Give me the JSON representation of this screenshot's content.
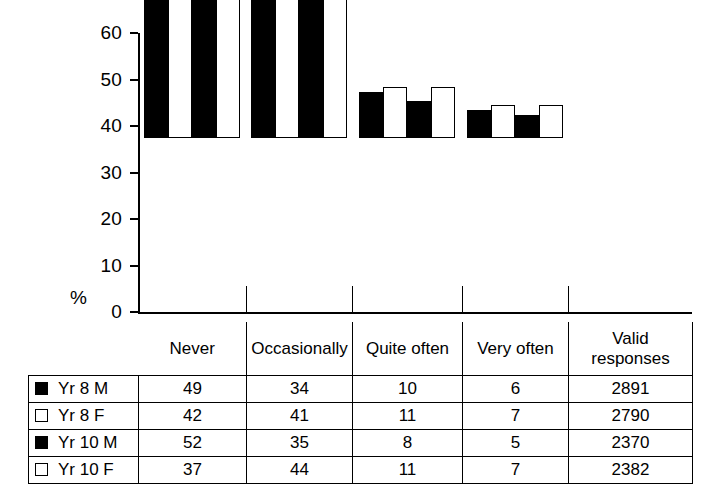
{
  "chart_data": {
    "type": "bar",
    "title": "",
    "xlabel": "",
    "ylabel": "%",
    "ylim": [
      0,
      60
    ],
    "yticks": [
      0,
      10,
      20,
      30,
      40,
      50,
      60
    ],
    "grid": false,
    "legend_position": "table-left-column",
    "categories": [
      "Never",
      "Occasionally",
      "Quite often",
      "Very often"
    ],
    "series": [
      {
        "name": "Yr 8 M",
        "marker": "filled",
        "values": [
          49,
          34,
          10,
          6
        ],
        "valid_responses": 2891
      },
      {
        "name": "Yr 8 F",
        "marker": "hollow",
        "values": [
          42,
          41,
          11,
          7
        ],
        "valid_responses": 2790
      },
      {
        "name": "Yr 10 M",
        "marker": "filled",
        "values": [
          52,
          35,
          8,
          5
        ],
        "valid_responses": 2370
      },
      {
        "name": "Yr 10 F",
        "marker": "hollow",
        "values": [
          37,
          44,
          11,
          7
        ],
        "valid_responses": 2382
      }
    ]
  },
  "axis": {
    "y_label": "%",
    "ticks": [
      "60",
      "50",
      "40",
      "30",
      "20",
      "10",
      "0"
    ]
  },
  "table": {
    "headers": [
      "",
      "Never",
      "Occasionally",
      "Quite often",
      "Valid\nresponses"
    ],
    "header_never": "Never",
    "header_occasionally": "Occasionally",
    "header_quite_often": "Quite often",
    "header_very_often": "Very often",
    "header_valid_line1": "Valid",
    "header_valid_line2": "responses",
    "rows": [
      {
        "name": "Yr 8 M",
        "never": "49",
        "occasionally": "34",
        "quite_often": "10",
        "very_often": "6",
        "valid": "2891"
      },
      {
        "name": "Yr 8 F",
        "never": "42",
        "occasionally": "41",
        "quite_often": "11",
        "very_often": "7",
        "valid": "2790"
      },
      {
        "name": "Yr 10 M",
        "never": "52",
        "occasionally": "35",
        "quite_often": "8",
        "very_often": "5",
        "valid": "2370"
      },
      {
        "name": "Yr 10 F",
        "never": "37",
        "occasionally": "44",
        "quite_often": "11",
        "very_often": "7",
        "valid": "2382"
      }
    ]
  },
  "colors": {
    "filled": "#000000",
    "hollow": "#ffffff",
    "line": "#000000"
  }
}
